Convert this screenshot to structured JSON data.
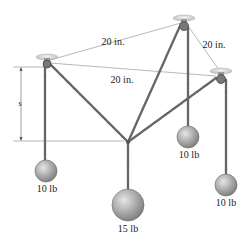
{
  "diagram": {
    "dimensions": {
      "top_left_to_top": "20 in.",
      "top_to_right": "20 in.",
      "left_to_right": "20 in.",
      "sag": "s"
    },
    "weights": {
      "left": "10 lb",
      "center": "15 lb",
      "middle_right": "10 lb",
      "right": "10 lb"
    },
    "colors": {
      "rope": "#6b6b6b",
      "weight_fill": "#a8a8a8",
      "pulley_bracket": "#d9d9d9",
      "dim_line": "#888888"
    }
  }
}
